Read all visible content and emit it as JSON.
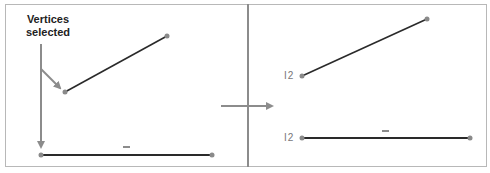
{
  "diagram": {
    "caption_line1": "Vertices",
    "caption_line2": "selected",
    "left_panel": {
      "segments": [
        {
          "name": "diagonal-segment",
          "from": [
            65,
            92
          ],
          "to": [
            167,
            36
          ]
        },
        {
          "name": "horizontal-segment",
          "from": [
            41,
            155
          ],
          "to": [
            212,
            155
          ],
          "tick_mark": "—"
        }
      ]
    },
    "right_panel": {
      "segments": [
        {
          "name": "diagonal-segment",
          "from": [
            302,
            76
          ],
          "to": [
            427,
            19
          ],
          "label": "I2"
        },
        {
          "name": "horizontal-segment",
          "from": [
            302,
            138
          ],
          "to": [
            470,
            138
          ],
          "label": "I2",
          "tick_mark": "—"
        }
      ]
    },
    "label_top": "I2",
    "label_bottom": "I2",
    "colors": {
      "segment": "#2a2a2a",
      "vertex": "#8a8a8a",
      "arrow": "#8c8c8c",
      "border": "#b8b8b8"
    }
  }
}
